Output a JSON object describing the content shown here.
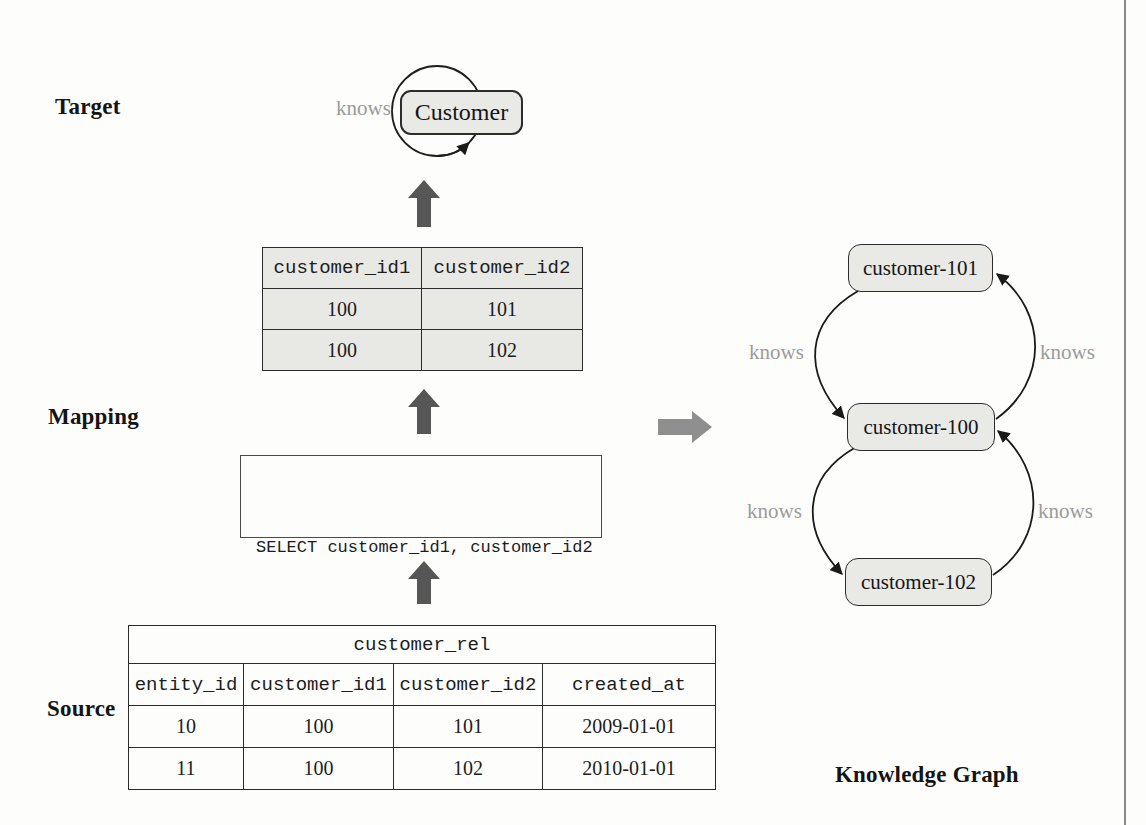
{
  "labels": {
    "target": "Target",
    "mapping": "Mapping",
    "source": "Source",
    "knowledge_graph": "Knowledge Graph"
  },
  "target_graph": {
    "node": "Customer",
    "self_edge_label": "knows"
  },
  "mapping": {
    "table": {
      "headers": [
        "customer_id1",
        "customer_id2"
      ],
      "rows": [
        [
          "100",
          "101"
        ],
        [
          "100",
          "102"
        ]
      ]
    },
    "sql": [
      "SELECT customer_id1, customer_id2",
      "FROM customer_entity"
    ]
  },
  "source": {
    "table_name": "customer_rel",
    "headers": [
      "entity_id",
      "customer_id1",
      "customer_id2",
      "created_at"
    ],
    "rows": [
      [
        "10",
        "100",
        "101",
        "2009-01-01"
      ],
      [
        "11",
        "100",
        "102",
        "2010-01-01"
      ]
    ]
  },
  "knowledge_graph": {
    "nodes": [
      "customer-101",
      "customer-100",
      "customer-102"
    ],
    "edges": [
      {
        "from": "customer-101",
        "to": "customer-100",
        "label": "knows"
      },
      {
        "from": "customer-100",
        "to": "customer-101",
        "label": "knows"
      },
      {
        "from": "customer-100",
        "to": "customer-102",
        "label": "knows"
      },
      {
        "from": "customer-102",
        "to": "customer-100",
        "label": "knows"
      }
    ]
  },
  "colors": {
    "node_fill": "#e9e9e6",
    "node_border": "#2c2c2c",
    "edge_label_gray": "#9b9b9b",
    "flow_arrow_dark": "#565656",
    "flow_arrow_light": "#8f8f8f",
    "mapping_cell_fill": "#e8e8e4",
    "page_edge_line": "#8a8a8a"
  }
}
